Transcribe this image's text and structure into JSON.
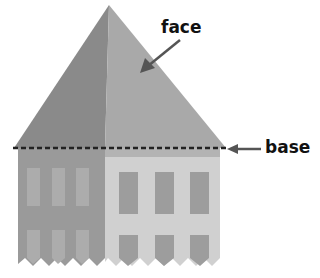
{
  "diagram": {
    "labels": {
      "face": "face",
      "base": "base"
    },
    "colors": {
      "left_face": "#8a8a8a",
      "right_face": "#a8a8a8",
      "left_wall": "#999999",
      "right_wall": "#cfcfcf",
      "left_window": "#adadad",
      "right_window": "#9c9c9c",
      "base_line": "#222222",
      "arrow": "#555555",
      "text": "#111111"
    }
  }
}
